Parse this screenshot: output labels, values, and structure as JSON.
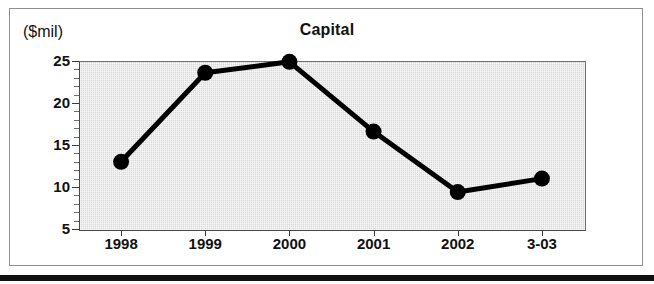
{
  "chart_data": {
    "type": "line",
    "title": "Capital",
    "xlabel": "",
    "ylabel": "($mil)",
    "categories": [
      "1998",
      "1999",
      "2000",
      "2001",
      "2002",
      "3-03"
    ],
    "values": [
      13.0,
      23.6,
      24.9,
      16.6,
      9.4,
      11.0
    ],
    "series": [
      {
        "name": "Capital",
        "values": [
          13.0,
          23.6,
          24.9,
          16.6,
          9.4,
          11.0
        ]
      }
    ],
    "ylim": [
      5,
      25
    ],
    "ytick_labels": [
      "5",
      "10",
      "15",
      "20",
      "25"
    ],
    "ytick_values": [
      5,
      10,
      15,
      20,
      25
    ],
    "yminor_step": 1,
    "grid": false,
    "legend": false,
    "legend_position": "none",
    "marker": "filled-circle",
    "line_color": "#000000",
    "marker_color": "#000000",
    "plot_background": "#d8d8d8",
    "figure_background": "#ffffff",
    "text_color": "#111111"
  },
  "figure": {
    "unit_label": "($mil)",
    "title": "Capital"
  }
}
